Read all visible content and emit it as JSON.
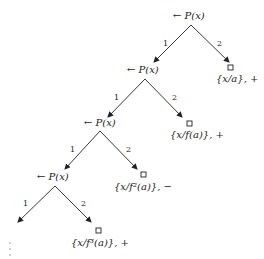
{
  "diagram": {
    "type": "sld-refutation-tree",
    "top_cut_text": "",
    "nodes": [
      {
        "id": "n1",
        "label": "← P(x)"
      },
      {
        "id": "n2",
        "label": "← P(x)"
      },
      {
        "id": "n3",
        "label": "← P(x)"
      },
      {
        "id": "n4",
        "label": "← P(x)"
      }
    ],
    "leaves": [
      {
        "id": "l1",
        "symbol": "□",
        "label": "{x/a}, +"
      },
      {
        "id": "l2",
        "symbol": "□",
        "label": "{x/f(a)}, +"
      },
      {
        "id": "l3",
        "symbol": "□",
        "label": "{x/f²(a)}, −"
      },
      {
        "id": "l4",
        "symbol": "□",
        "label": "{x/f³(a)}, +"
      }
    ],
    "edges": [
      {
        "from": "n1",
        "to": "n2",
        "label": "1"
      },
      {
        "from": "n1",
        "to": "l1",
        "label": "2"
      },
      {
        "from": "n2",
        "to": "n3",
        "label": "1"
      },
      {
        "from": "n2",
        "to": "l2",
        "label": "2"
      },
      {
        "from": "n3",
        "to": "n4",
        "label": "1"
      },
      {
        "from": "n3",
        "to": "l3",
        "label": "2"
      },
      {
        "from": "n4",
        "to": "continuation",
        "label": "1"
      },
      {
        "from": "n4",
        "to": "l4",
        "label": "2"
      }
    ],
    "continuation": "⋮"
  }
}
